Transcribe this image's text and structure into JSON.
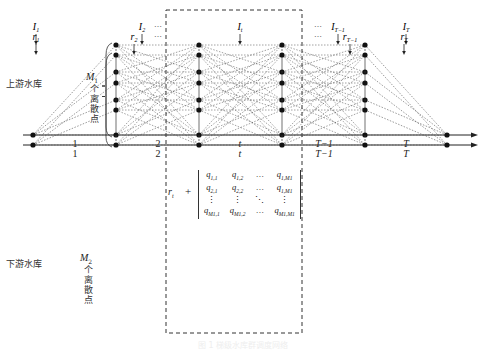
{
  "upper": {
    "label": "上游水库",
    "bracket_label_var": "M",
    "bracket_label_sub": "1",
    "bracket_label_text": "个离散点",
    "inflows": [
      {
        "sym": "I",
        "sub": "1",
        "x": 36
      },
      {
        "sym": "I",
        "sub": "2",
        "x": 142
      },
      {
        "sym": "I",
        "sub": "t",
        "x": 240
      },
      {
        "sym": "I",
        "sub": "T−1",
        "x": 338
      },
      {
        "sym": "I",
        "sub": "T",
        "x": 406
      }
    ],
    "ellipsis": [
      "…",
      "…"
    ],
    "axis_y": 135,
    "levels_y": [
      45,
      72,
      100,
      135
    ]
  },
  "lower": {
    "label": "下游水库",
    "bracket_label_var": "M",
    "bracket_label_sub": "2",
    "bracket_label_text": "个离散点",
    "inflows": [
      {
        "sym": "r",
        "sub": "1",
        "x": 36
      },
      {
        "sym": "r",
        "sub": "2",
        "x": 134
      },
      {
        "sym": "r",
        "sub": "T−1",
        "x": 350
      },
      {
        "sym": "r",
        "sub": "T",
        "x": 404
      }
    ],
    "ellipsis": [
      "…",
      "…"
    ],
    "axis_y": 145,
    "levels_y": [
      55,
      83,
      110,
      145
    ]
  },
  "columns_x": [
    116,
    199,
    282,
    365
  ],
  "start_x": 33,
  "end_x": 447,
  "periods": [
    "1",
    "2",
    "t",
    "T−1",
    "T"
  ],
  "matrix": {
    "prefix": "r",
    "prefix_sub": "t",
    "plus": "+",
    "rows": [
      [
        "q1,1",
        "q1,2",
        "···",
        "q1,M1"
      ],
      [
        "q2,1",
        "q2,2",
        "···",
        "q1,M1"
      ],
      [
        "⋮",
        "⋮",
        "⋱",
        "⋮"
      ],
      [
        "qM1,1",
        "qM1,2",
        "···",
        "qM1,M1"
      ]
    ]
  },
  "caption": "图 1  梯级水库群调度网络"
}
